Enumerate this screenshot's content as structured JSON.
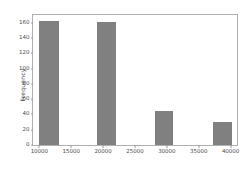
{
  "chart_data": {
    "type": "bar",
    "title": "",
    "xlabel": "",
    "ylabel": "Frequency",
    "grid": false,
    "legend": null,
    "xlim": [
      9000,
      41000
    ],
    "ylim": [
      0,
      170
    ],
    "xticks": [
      10000,
      15000,
      20000,
      25000,
      30000,
      35000,
      40000
    ],
    "xtick_labels": [
      "10000",
      "15000",
      "20000",
      "25000",
      "30000",
      "35000",
      "40000"
    ],
    "yticks": [
      0,
      20,
      40,
      60,
      80,
      100,
      120,
      140,
      160
    ],
    "ytick_labels": [
      "0",
      "20",
      "40",
      "60",
      "80",
      "100",
      "120",
      "140",
      "160"
    ],
    "bar_color": "#808080",
    "axes_color": "#b0b0b0",
    "bars": [
      {
        "label": "10000-13000",
        "x_start": 10000,
        "x_end": 13000,
        "value": 162
      },
      {
        "label": "19000-22000",
        "x_start": 19000,
        "x_end": 22000,
        "value": 161
      },
      {
        "label": "28200-31000",
        "x_start": 28200,
        "x_end": 31000,
        "value": 45
      },
      {
        "label": "37300-40200",
        "x_start": 37300,
        "x_end": 40200,
        "value": 30
      }
    ],
    "categories": [
      "10000-13000",
      "19000-22000",
      "28200-31000",
      "37300-40200"
    ],
    "values": [
      162,
      161,
      45,
      30
    ]
  }
}
